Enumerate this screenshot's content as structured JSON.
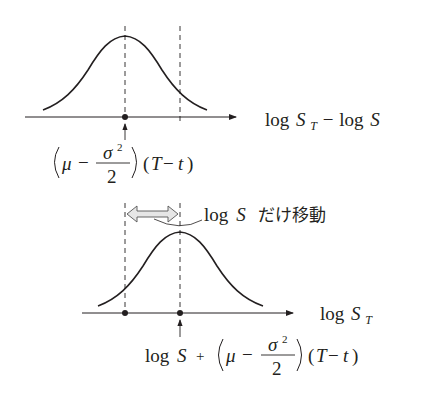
{
  "diagram": {
    "type": "distribution-shift",
    "top_panel": {
      "axis_label": {
        "log": "log",
        "S": "S",
        "sub": "T",
        "minus": "−",
        "log2": "log",
        "S2": "S"
      },
      "mean_formula": {
        "mu": "μ",
        "minus": "−",
        "num": "σ",
        "sup": "2",
        "den": "2",
        "tail_open": "(",
        "T": "T",
        "minus2": "−",
        "t": "t",
        "tail_close": ")"
      }
    },
    "shift_annotation": {
      "log": "log",
      "S": "S",
      "text": "だけ移動"
    },
    "bottom_panel": {
      "axis_label": {
        "log": "log",
        "S": "S",
        "sub": "T"
      },
      "mean_formula": {
        "log": "log",
        "S": "S",
        "plus": "+",
        "mu": "μ",
        "minus": "−",
        "num": "σ",
        "sup": "2",
        "den": "2",
        "tail_open": "(",
        "T": "T",
        "minus2": "−",
        "t": "t",
        "tail_close": ")"
      }
    },
    "colors": {
      "line": "#231f20",
      "arrow_fill": "#e6e6e6"
    }
  }
}
